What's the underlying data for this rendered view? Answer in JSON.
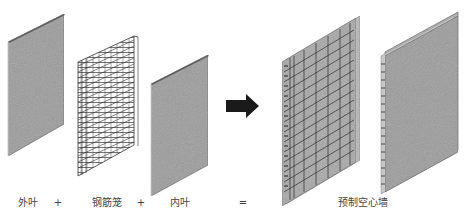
{
  "diagram": {
    "components": [
      {
        "id": "outer-leaf",
        "label": "外叶",
        "label_x": 28
      },
      {
        "id": "rebar-cage",
        "label": "钢筋笼",
        "label_x": 107
      },
      {
        "id": "inner-leaf",
        "label": "内叶",
        "label_x": 180
      },
      {
        "id": "result",
        "label": "预制空心墙",
        "label_x": 363
      }
    ],
    "operators": [
      {
        "symbol": "+",
        "x": 58
      },
      {
        "symbol": "+",
        "x": 141
      },
      {
        "symbol": "=",
        "x": 243
      }
    ],
    "arrow": {
      "icon": "right-arrow-icon",
      "color": "#1a1a1a"
    },
    "colors": {
      "panel_fill": "#9a9a9a",
      "panel_edge": "#5a5a5a",
      "rebar": "#333333",
      "text": "#444444"
    }
  }
}
